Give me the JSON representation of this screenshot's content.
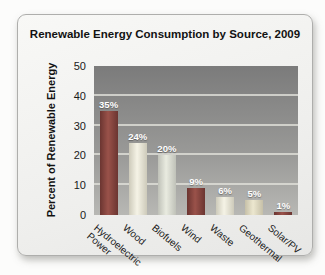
{
  "card": {
    "title": "Renewable Energy Consumption by Source, 2009"
  },
  "chart_data": {
    "type": "bar",
    "title": "Renewable Energy Consumption by Source, 2009",
    "xlabel": "",
    "ylabel": "Percent of Renewable Energy",
    "ylim": [
      0,
      50
    ],
    "yticks": [
      0,
      10,
      20,
      30,
      40,
      50
    ],
    "grid": "horizontal",
    "legend": "none",
    "categories": [
      "Hydroelectric Power",
      "Wood",
      "Biofuels",
      "Wind",
      "Waste",
      "Geothermal",
      "Solar/PV"
    ],
    "tick_labels": [
      "Hydroelectric\nPower",
      "Wood",
      "Biofuels",
      "Wind",
      "Waste",
      "Geothermal",
      "Solar/PV"
    ],
    "values": [
      35,
      24,
      20,
      9,
      6,
      5,
      1
    ],
    "value_labels": [
      "35%",
      "24%",
      "20%",
      "9%",
      "6%",
      "5%",
      "1%"
    ],
    "bar_styles": [
      "maroon",
      "cream",
      "silver",
      "maroon",
      "cream",
      "tan",
      "maroon"
    ],
    "palette": {
      "maroon": {
        "edge": "#6b3531",
        "center": "#9a524a"
      },
      "cream": {
        "edge": "#cdcaba",
        "center": "#f5f3e6"
      },
      "silver": {
        "edge": "#bfc1b8",
        "center": "#e9ebe0"
      },
      "tan": {
        "edge": "#c6c0a8",
        "center": "#ece7cf"
      }
    },
    "plot_bg_top": "#7b7b7b",
    "plot_bg_bottom": "#b8b8b4",
    "gridline_color": "#e0e0da"
  }
}
